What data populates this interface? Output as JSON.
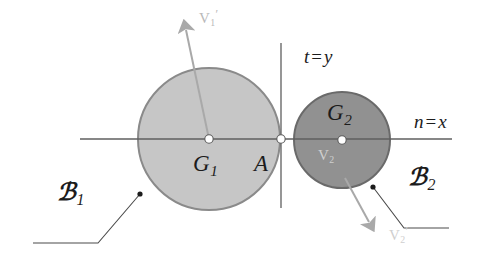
{
  "figure": {
    "background_color": "#ffffff",
    "width": 490,
    "height": 257
  },
  "colors": {
    "body1_fill": "#c6c6c6",
    "body1_stroke": "#8a8a8a",
    "body2_fill": "#919191",
    "body2_stroke": "#6a6a6a",
    "axis_line": "#707070",
    "leader_line": "#555555",
    "arrow_gray": "#a9a9a9",
    "label_dark": "#1c1c1c",
    "label_faint": "#bcbcbc"
  },
  "bodies": [
    {
      "id": "body-1",
      "center_label": "G",
      "center_subscript": "1",
      "body_label": "B",
      "body_subscript": "1",
      "cx": 209,
      "cy": 139,
      "r": 71,
      "fill": "#c6c6c6",
      "stroke": "#8a8a8a"
    },
    {
      "id": "body-2",
      "center_label": "G",
      "center_subscript": "2",
      "body_label": "B",
      "body_subscript": "2",
      "cx": 342,
      "cy": 140,
      "r": 48,
      "fill": "#919191",
      "stroke": "#6a6a6a"
    }
  ],
  "points": {
    "contact": {
      "label": "A",
      "x": 280,
      "y": 139
    },
    "center1": {
      "x": 209,
      "y": 139
    },
    "center2": {
      "x": 342,
      "y": 140
    }
  },
  "axes": {
    "normal": {
      "label_main": "n",
      "label_eq": "=",
      "label_var": "x",
      "text": "n = x",
      "orientation": "horizontal",
      "y": 139,
      "x_start": 80,
      "x_end": 452
    },
    "tangent": {
      "label_main": "t",
      "label_eq": "=",
      "label_var": "y",
      "text": "t = y",
      "orientation": "vertical",
      "x": 281,
      "y_start": 43,
      "y_end": 208
    }
  },
  "vectors": [
    {
      "id": "v1-prime",
      "label": "V",
      "subscript": "1",
      "prime": "′",
      "color": "#a9a9a9",
      "from_x": 209,
      "from_y": 139,
      "to_x": 184,
      "to_y": 18,
      "direction": "up-left"
    },
    {
      "id": "v2-prime",
      "label": "V",
      "subscript": "2",
      "prime": "′",
      "color": "#a9a9a9",
      "from_x": 345,
      "from_y": 178,
      "to_x": 372,
      "to_y": 230,
      "direction": "down-right"
    }
  ],
  "faint_labels": [
    {
      "id": "v2-inner",
      "label": "V",
      "subscript": "2",
      "prime": "",
      "color": "#c2c2c2"
    }
  ],
  "leaders": [
    {
      "id": "leader-b1",
      "dot_x": 140,
      "dot_y": 194,
      "elbow_x": 98,
      "elbow_y": 243,
      "end_x": 33,
      "end_y": 243
    },
    {
      "id": "leader-b2",
      "dot_x": 373,
      "dot_y": 187,
      "elbow_x": 404,
      "elbow_y": 228,
      "end_x": 449,
      "end_y": 228
    }
  ],
  "labels": {
    "v1_prime": {
      "text": "V",
      "sub": "1",
      "prime": "′"
    },
    "v2_prime": {
      "text": "V",
      "sub": "2",
      "prime": "′"
    },
    "v2_inner": {
      "text": "V",
      "sub": "2"
    },
    "g1": {
      "text": "G",
      "sub": "1"
    },
    "g2": {
      "text": "G",
      "sub": "2"
    },
    "b1": {
      "text": "ℬ",
      "sub": "1"
    },
    "b2": {
      "text": "ℬ",
      "sub": "2"
    },
    "contact": {
      "text": "A"
    },
    "t_eq_y": {
      "var1": "t",
      "eq": "=",
      "var2": "y"
    },
    "n_eq_x": {
      "var1": "n",
      "eq": "=",
      "var2": "x"
    }
  }
}
